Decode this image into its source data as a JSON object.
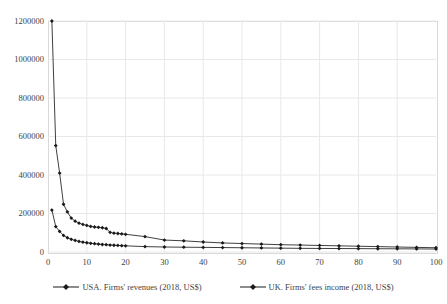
{
  "chart_data": {
    "type": "line",
    "title": "",
    "subtitle": "",
    "xlabel": "",
    "ylabel": "",
    "xlim": [
      0,
      100
    ],
    "ylim": [
      0,
      1200000
    ],
    "xticks": [
      0,
      10,
      20,
      30,
      40,
      50,
      60,
      70,
      80,
      90,
      100
    ],
    "yticks": [
      0,
      200000,
      400000,
      600000,
      800000,
      1000000,
      1200000
    ],
    "grid": true,
    "legend_position": "bottom",
    "marker": "diamond",
    "line_color": "#404040",
    "marker_color": "#1a1a1a",
    "gridline_color": "#e8e8e8",
    "series": [
      {
        "name": "USA. Firms' revenues (2018, US$)",
        "x": [
          1,
          2,
          3,
          4,
          5,
          6,
          7,
          8,
          9,
          10,
          11,
          12,
          13,
          14,
          15,
          16,
          17,
          18,
          19,
          20,
          25,
          30,
          35,
          40,
          45,
          50,
          55,
          60,
          65,
          70,
          75,
          80,
          85,
          90,
          95,
          100
        ],
        "values": [
          1200000,
          553000,
          410000,
          248000,
          208000,
          176000,
          160000,
          150000,
          143000,
          138000,
          133000,
          130000,
          128000,
          126000,
          122000,
          102000,
          98000,
          96000,
          94000,
          92000,
          80000,
          62000,
          58000,
          52000,
          47000,
          44000,
          41000,
          38000,
          36000,
          34000,
          32000,
          30000,
          28000,
          26000,
          24000,
          22000
        ]
      },
      {
        "name": "UK. Firms' fees income (2018, US$)",
        "x": [
          1,
          2,
          3,
          4,
          5,
          6,
          7,
          8,
          9,
          10,
          11,
          12,
          13,
          14,
          15,
          16,
          17,
          18,
          19,
          20,
          25,
          30,
          35,
          40,
          45,
          50,
          55,
          60,
          65,
          70,
          75,
          80,
          85,
          90,
          95,
          100
        ],
        "values": [
          218000,
          132000,
          107000,
          86000,
          74000,
          66000,
          60000,
          55000,
          51000,
          48000,
          45000,
          43000,
          41000,
          39000,
          38000,
          36000,
          35000,
          34000,
          33000,
          32000,
          28000,
          26000,
          25000,
          24000,
          23000,
          22000,
          21000,
          20000,
          19000,
          18500,
          18000,
          17500,
          17000,
          16500,
          16000,
          15500
        ]
      }
    ]
  }
}
